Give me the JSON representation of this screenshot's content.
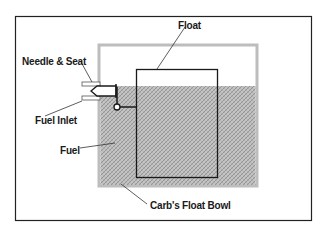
{
  "diagram": {
    "labels": {
      "float": "Float",
      "needle_seat": "Needle & Seat",
      "fuel_inlet": "Fuel Inlet",
      "fuel": "Fuel",
      "float_bowl": "Carb's Float Bowl"
    },
    "colors": {
      "frame": "#222222",
      "bowl_wall": "#bdbdbd",
      "fuel_fill": "#a8a8a8",
      "line": "#1a1a1a"
    }
  }
}
